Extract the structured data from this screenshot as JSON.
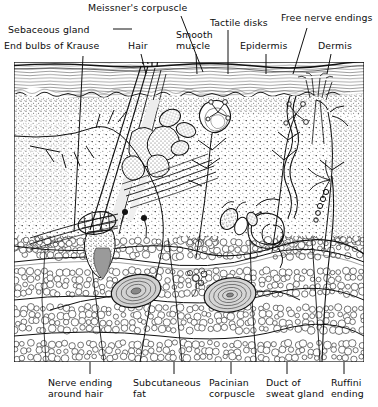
{
  "figure": {
    "type": "anatomical-cross-section",
    "panel": {
      "x": 14,
      "y": 62,
      "width": 350,
      "height": 300
    },
    "layers": [
      {
        "name": "epidermis",
        "top": 62,
        "bottom": 98,
        "fill": "#ffffff",
        "pattern": "horizontal-striations"
      },
      {
        "name": "dermis",
        "top": 98,
        "bottom": 250,
        "fill": "#ffffff",
        "pattern": "stipple"
      },
      {
        "name": "subcutaneous-fat",
        "top": 230,
        "bottom": 362,
        "fill": "#ffffff",
        "pattern": "adipocyte-bubbles"
      }
    ],
    "ink": "#1a1a1a",
    "background": "#ffffff"
  },
  "labels_top": [
    {
      "id": "meissners-corpuscle",
      "text": "Meissner's corpuscle",
      "x": 88,
      "y": 2,
      "align": "left",
      "leader": {
        "x1": 181,
        "y1": 16,
        "x2": 203,
        "y2": 72
      }
    },
    {
      "id": "sebaceous-gland",
      "text": "Sebaceous gland",
      "x": 8,
      "y": 24,
      "align": "left",
      "leader": {
        "x1": 113,
        "y1": 29,
        "x2": 132,
        "y2": 29
      }
    },
    {
      "id": "hair",
      "text": "Hair",
      "x": 128,
      "y": 40,
      "align": "left",
      "leader": {
        "x1": 141,
        "y1": 54,
        "x2": 146,
        "y2": 74
      }
    },
    {
      "id": "smooth-muscle",
      "text": "Smooth\nmuscle",
      "x": 176,
      "y": 30,
      "align": "left",
      "leader": {
        "x1": 196,
        "y1": 54,
        "x2": 197,
        "y2": 74
      }
    },
    {
      "id": "tactile-disks",
      "text": "Tactile disks",
      "x": 210,
      "y": 17,
      "align": "left",
      "leader": {
        "x1": 228,
        "y1": 30,
        "x2": 228,
        "y2": 74
      }
    },
    {
      "id": "epidermis",
      "text": "Epidermis",
      "x": 240,
      "y": 40,
      "align": "left",
      "leader": {
        "x1": 266,
        "y1": 54,
        "x2": 266,
        "y2": 74
      }
    },
    {
      "id": "free-nerve-endings",
      "text": "Free nerve endings",
      "x": 281,
      "y": 12,
      "align": "left",
      "leader": {
        "x1": 307,
        "y1": 28,
        "x2": 293,
        "y2": 74
      }
    },
    {
      "id": "dermis",
      "text": "Dermis",
      "x": 318,
      "y": 40,
      "align": "left",
      "leader": {
        "x1": 331,
        "y1": 54,
        "x2": 327,
        "y2": 74
      }
    },
    {
      "id": "end-bulbs-of-krause",
      "text": "End bulbs of Krause",
      "x": 4,
      "y": 40,
      "align": "left",
      "leader": {
        "x1": 83,
        "y1": 56,
        "x2": 74,
        "y2": 232
      }
    }
  ],
  "labels_bottom": [
    {
      "id": "nerve-ending-around-hair",
      "text": "Nerve ending\naround hair",
      "x": 48,
      "y": 377,
      "leader": {
        "x1": 90,
        "y1": 362,
        "x2": 90,
        "y2": 374
      }
    },
    {
      "id": "subcutaneous-fat",
      "text": "Subcutaneous\nfat",
      "x": 133,
      "y": 377,
      "leader": {
        "x1": 174,
        "y1": 362,
        "x2": 174,
        "y2": 374
      }
    },
    {
      "id": "pacinian-corpuscle",
      "text": "Pacinian\ncorpuscle",
      "x": 209,
      "y": 377,
      "leader": {
        "x1": 231,
        "y1": 362,
        "x2": 231,
        "y2": 374
      }
    },
    {
      "id": "duct-of-sweat-gland",
      "text": "Duct of\nsweat gland",
      "x": 266,
      "y": 377,
      "leader": {
        "x1": 287,
        "y1": 362,
        "x2": 287,
        "y2": 374
      }
    },
    {
      "id": "ruffini-ending",
      "text": "Ruffini\nending",
      "x": 331,
      "y": 377,
      "leader": {
        "x1": 344,
        "y1": 362,
        "x2": 344,
        "y2": 374
      }
    }
  ],
  "structures": [
    {
      "id": "hair-shaft",
      "name": "Hair shaft"
    },
    {
      "id": "hair-follicle",
      "name": "Hair follicle"
    },
    {
      "id": "sebaceous-gland-lobes",
      "name": "Sebaceous gland lobes"
    },
    {
      "id": "arrector-pili-muscle",
      "name": "Arrector pili (smooth) muscle"
    },
    {
      "id": "meissner-corpuscle",
      "name": "Meissner's corpuscle"
    },
    {
      "id": "merkel-tactile-disks",
      "name": "Tactile (Merkel) disks"
    },
    {
      "id": "free-nerve-ending",
      "name": "Free nerve endings"
    },
    {
      "id": "pacinian-corpuscle-left",
      "name": "Pacinian corpuscle (left)"
    },
    {
      "id": "pacinian-corpuscle-right",
      "name": "Pacinian corpuscle (right)"
    },
    {
      "id": "sweat-gland-coil",
      "name": "Coiled sweat gland"
    },
    {
      "id": "sweat-gland-duct",
      "name": "Sweat gland duct"
    },
    {
      "id": "ruffini-ending",
      "name": "Ruffini ending"
    },
    {
      "id": "krause-end-bulb",
      "name": "End bulb of Krause"
    },
    {
      "id": "nerve-trunk",
      "name": "Nerve trunk"
    }
  ]
}
